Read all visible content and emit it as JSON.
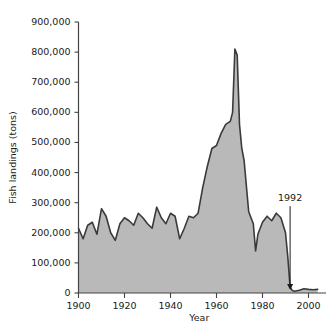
{
  "chart_data": {
    "type": "area",
    "title": "",
    "xlabel": "Year",
    "ylabel": "Fish landings (tons)",
    "xlim": [
      1900,
      2005
    ],
    "ylim": [
      0,
      900000
    ],
    "grid": false,
    "legend": "none",
    "xticks": [
      1900,
      1920,
      1940,
      1960,
      1980,
      2000
    ],
    "xtick_labels": [
      "1900",
      "1920",
      "1940",
      "1960",
      "1980",
      "2000"
    ],
    "yticks": [
      0,
      100000,
      200000,
      300000,
      400000,
      500000,
      600000,
      700000,
      800000,
      900000
    ],
    "ytick_labels": [
      "0",
      "100,000",
      "200,000",
      "300,000",
      "400,000",
      "500,000",
      "600,000",
      "700,000",
      "800,000",
      "900,000"
    ],
    "annotations": [
      {
        "text": "1992",
        "x": 1992,
        "y": 0,
        "label_x": 1992,
        "label_y": 305000,
        "arrow": "down"
      }
    ],
    "colors": {
      "fill": "#b9b9b9",
      "line": "#3a3a3a",
      "axis": "#444444",
      "text": "#1a1a1a",
      "background": "#ffffff"
    },
    "x": [
      1900,
      1902,
      1904,
      1906,
      1908,
      1910,
      1912,
      1914,
      1916,
      1918,
      1920,
      1922,
      1924,
      1926,
      1928,
      1930,
      1932,
      1934,
      1936,
      1938,
      1940,
      1942,
      1944,
      1946,
      1948,
      1950,
      1952,
      1954,
      1956,
      1958,
      1960,
      1962,
      1964,
      1966,
      1967,
      1968,
      1969,
      1970,
      1971,
      1972,
      1974,
      1976,
      1977,
      1978,
      1980,
      1982,
      1984,
      1986,
      1988,
      1990,
      1991,
      1992,
      1993,
      1994,
      1996,
      1998,
      2000,
      2002,
      2004
    ],
    "values": [
      215000,
      180000,
      225000,
      235000,
      195000,
      280000,
      255000,
      200000,
      175000,
      230000,
      250000,
      240000,
      225000,
      265000,
      250000,
      230000,
      215000,
      285000,
      250000,
      230000,
      265000,
      255000,
      180000,
      215000,
      255000,
      250000,
      265000,
      350000,
      420000,
      480000,
      490000,
      530000,
      560000,
      570000,
      600000,
      810000,
      790000,
      560000,
      480000,
      440000,
      270000,
      230000,
      140000,
      195000,
      235000,
      255000,
      240000,
      265000,
      250000,
      200000,
      120000,
      20000,
      8000,
      6000,
      9000,
      14000,
      12000,
      11000,
      12000
    ],
    "series_name": "Fish landings"
  },
  "axes": {
    "y_axis_title": "Fish landings (tons)",
    "x_axis_title": "Year"
  }
}
